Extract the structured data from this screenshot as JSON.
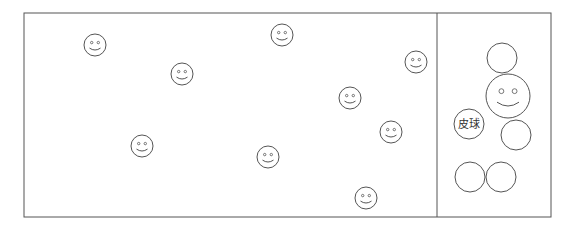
{
  "figure": {
    "label_ball": "皮球",
    "stroke_color": "#555555",
    "frame": {
      "left": 24,
      "top": 13,
      "right": 551,
      "bottom": 217,
      "divider_x": 437
    }
  },
  "left_panel": {
    "smileys": [
      {
        "x": 95,
        "y": 45,
        "r": 11
      },
      {
        "x": 182,
        "y": 74,
        "r": 11
      },
      {
        "x": 282,
        "y": 35,
        "r": 11
      },
      {
        "x": 416,
        "y": 62,
        "r": 11
      },
      {
        "x": 350,
        "y": 98,
        "r": 11
      },
      {
        "x": 391,
        "y": 132,
        "r": 11
      },
      {
        "x": 142,
        "y": 146,
        "r": 11
      },
      {
        "x": 268,
        "y": 157,
        "r": 11
      },
      {
        "x": 366,
        "y": 198,
        "r": 11
      }
    ]
  },
  "right_panel": {
    "circles": [
      {
        "x": 502,
        "y": 58,
        "r": 15
      },
      {
        "x": 516,
        "y": 135,
        "r": 15
      },
      {
        "x": 470,
        "y": 177,
        "r": 15
      },
      {
        "x": 501,
        "y": 177,
        "r": 15
      }
    ],
    "big_smiley": {
      "x": 508,
      "y": 96,
      "r": 22
    },
    "ball": {
      "x": 469,
      "y": 124,
      "r": 15
    }
  }
}
